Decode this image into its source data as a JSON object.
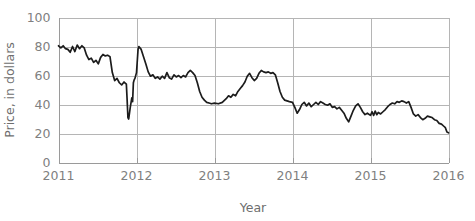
{
  "chart_data": {
    "type": "line",
    "title": "",
    "xlabel": "Year",
    "ylabel": "Price, in dollars",
    "xlim": [
      2011,
      2016
    ],
    "ylim": [
      0,
      100
    ],
    "grid": true,
    "legend": "none",
    "x_ticks": [
      "2011",
      "2012",
      "2013",
      "2014",
      "2015",
      "2016"
    ],
    "x_tick_values": [
      2011,
      2012,
      2013,
      2014,
      2015,
      2016
    ],
    "y_ticks": [
      "0",
      "20",
      "40",
      "60",
      "80",
      "100"
    ],
    "y_tick_values": [
      0,
      20,
      40,
      60,
      80,
      100
    ],
    "series": [
      {
        "name": "Price",
        "color": "#1c1c1c",
        "points": [
          [
            2011.0,
            80.5
          ],
          [
            2011.03,
            79.0
          ],
          [
            2011.06,
            80.5
          ],
          [
            2011.09,
            78.5
          ],
          [
            2011.12,
            78.0
          ],
          [
            2011.15,
            76.0
          ],
          [
            2011.18,
            80.0
          ],
          [
            2011.21,
            76.5
          ],
          [
            2011.24,
            81.0
          ],
          [
            2011.27,
            78.5
          ],
          [
            2011.3,
            80.5
          ],
          [
            2011.33,
            79.0
          ],
          [
            2011.36,
            74.0
          ],
          [
            2011.39,
            71.0
          ],
          [
            2011.42,
            72.0
          ],
          [
            2011.45,
            69.0
          ],
          [
            2011.48,
            70.5
          ],
          [
            2011.51,
            68.0
          ],
          [
            2011.54,
            72.5
          ],
          [
            2011.57,
            74.5
          ],
          [
            2011.6,
            73.5
          ],
          [
            2011.63,
            74.0
          ],
          [
            2011.66,
            73.0
          ],
          [
            2011.69,
            62.0
          ],
          [
            2011.72,
            56.5
          ],
          [
            2011.75,
            58.0
          ],
          [
            2011.78,
            55.0
          ],
          [
            2011.81,
            53.5
          ],
          [
            2011.84,
            55.5
          ],
          [
            2011.87,
            54.0
          ],
          [
            2011.88,
            43.0
          ],
          [
            2011.89,
            31.0
          ],
          [
            2011.9,
            30.0
          ],
          [
            2011.92,
            38.0
          ],
          [
            2011.94,
            44.5
          ],
          [
            2011.95,
            42.0
          ],
          [
            2011.96,
            55.0
          ],
          [
            2011.97,
            57.0
          ],
          [
            2011.98,
            58.0
          ],
          [
            2012.0,
            62.0
          ],
          [
            2012.01,
            70.0
          ],
          [
            2012.02,
            78.0
          ],
          [
            2012.03,
            80.0
          ],
          [
            2012.06,
            78.0
          ],
          [
            2012.09,
            73.0
          ],
          [
            2012.12,
            68.0
          ],
          [
            2012.15,
            62.5
          ],
          [
            2012.18,
            59.5
          ],
          [
            2012.21,
            60.5
          ],
          [
            2012.24,
            58.0
          ],
          [
            2012.27,
            59.0
          ],
          [
            2012.3,
            57.5
          ],
          [
            2012.33,
            59.5
          ],
          [
            2012.36,
            58.0
          ],
          [
            2012.39,
            62.0
          ],
          [
            2012.42,
            58.5
          ],
          [
            2012.45,
            57.5
          ],
          [
            2012.48,
            60.5
          ],
          [
            2012.51,
            59.0
          ],
          [
            2012.54,
            60.0
          ],
          [
            2012.57,
            58.5
          ],
          [
            2012.6,
            60.0
          ],
          [
            2012.63,
            59.0
          ],
          [
            2012.66,
            62.0
          ],
          [
            2012.69,
            63.5
          ],
          [
            2012.72,
            62.0
          ],
          [
            2012.75,
            60.0
          ],
          [
            2012.78,
            55.0
          ],
          [
            2012.81,
            49.0
          ],
          [
            2012.84,
            45.0
          ],
          [
            2012.87,
            43.0
          ],
          [
            2012.9,
            41.5
          ],
          [
            2012.93,
            41.0
          ],
          [
            2012.96,
            40.5
          ],
          [
            2013.0,
            41.0
          ],
          [
            2013.05,
            40.5
          ],
          [
            2013.1,
            41.5
          ],
          [
            2013.15,
            44.0
          ],
          [
            2013.18,
            46.0
          ],
          [
            2013.21,
            45.0
          ],
          [
            2013.24,
            47.0
          ],
          [
            2013.27,
            46.0
          ],
          [
            2013.3,
            49.0
          ],
          [
            2013.33,
            51.0
          ],
          [
            2013.36,
            53.0
          ],
          [
            2013.39,
            55.5
          ],
          [
            2013.42,
            59.5
          ],
          [
            2013.45,
            61.5
          ],
          [
            2013.48,
            58.5
          ],
          [
            2013.51,
            56.5
          ],
          [
            2013.54,
            58.0
          ],
          [
            2013.57,
            61.5
          ],
          [
            2013.6,
            63.5
          ],
          [
            2013.63,
            62.5
          ],
          [
            2013.66,
            62.0
          ],
          [
            2013.69,
            62.5
          ],
          [
            2013.72,
            61.5
          ],
          [
            2013.75,
            62.0
          ],
          [
            2013.78,
            60.5
          ],
          [
            2013.81,
            55.0
          ],
          [
            2013.84,
            49.0
          ],
          [
            2013.87,
            45.0
          ],
          [
            2013.9,
            43.0
          ],
          [
            2013.93,
            42.5
          ],
          [
            2013.96,
            42.0
          ],
          [
            2014.0,
            41.5
          ],
          [
            2014.03,
            38.0
          ],
          [
            2014.06,
            34.0
          ],
          [
            2014.09,
            36.5
          ],
          [
            2014.12,
            40.0
          ],
          [
            2014.15,
            41.5
          ],
          [
            2014.18,
            39.0
          ],
          [
            2014.21,
            41.0
          ],
          [
            2014.24,
            38.5
          ],
          [
            2014.27,
            40.0
          ],
          [
            2014.3,
            41.5
          ],
          [
            2014.33,
            40.0
          ],
          [
            2014.36,
            42.0
          ],
          [
            2014.39,
            41.0
          ],
          [
            2014.42,
            40.0
          ],
          [
            2014.45,
            39.5
          ],
          [
            2014.48,
            40.5
          ],
          [
            2014.51,
            38.0
          ],
          [
            2014.54,
            38.5
          ],
          [
            2014.57,
            37.0
          ],
          [
            2014.6,
            38.0
          ],
          [
            2014.63,
            36.0
          ],
          [
            2014.66,
            34.0
          ],
          [
            2014.69,
            30.5
          ],
          [
            2014.72,
            28.0
          ],
          [
            2014.75,
            32.0
          ],
          [
            2014.78,
            36.0
          ],
          [
            2014.81,
            39.0
          ],
          [
            2014.84,
            40.5
          ],
          [
            2014.87,
            38.0
          ],
          [
            2014.9,
            35.0
          ],
          [
            2014.93,
            33.0
          ],
          [
            2014.96,
            34.0
          ],
          [
            2015.0,
            32.5
          ],
          [
            2015.02,
            35.0
          ],
          [
            2015.04,
            32.5
          ],
          [
            2015.06,
            35.5
          ],
          [
            2015.08,
            33.0
          ],
          [
            2015.1,
            34.5
          ],
          [
            2015.13,
            33.5
          ],
          [
            2015.16,
            35.0
          ],
          [
            2015.19,
            36.5
          ],
          [
            2015.22,
            38.5
          ],
          [
            2015.25,
            40.0
          ],
          [
            2015.28,
            41.0
          ],
          [
            2015.31,
            40.5
          ],
          [
            2015.34,
            42.0
          ],
          [
            2015.37,
            41.5
          ],
          [
            2015.4,
            42.5
          ],
          [
            2015.43,
            42.0
          ],
          [
            2015.46,
            41.0
          ],
          [
            2015.49,
            42.0
          ],
          [
            2015.52,
            38.0
          ],
          [
            2015.55,
            33.5
          ],
          [
            2015.58,
            32.0
          ],
          [
            2015.61,
            33.0
          ],
          [
            2015.64,
            31.0
          ],
          [
            2015.67,
            29.5
          ],
          [
            2015.7,
            30.5
          ],
          [
            2015.73,
            32.0
          ],
          [
            2015.76,
            31.5
          ],
          [
            2015.79,
            31.0
          ],
          [
            2015.82,
            29.5
          ],
          [
            2015.85,
            29.0
          ],
          [
            2015.88,
            27.0
          ],
          [
            2015.91,
            26.5
          ],
          [
            2015.94,
            25.0
          ],
          [
            2015.96,
            24.0
          ],
          [
            2015.98,
            21.0
          ],
          [
            2016.0,
            20.5
          ]
        ]
      }
    ]
  }
}
